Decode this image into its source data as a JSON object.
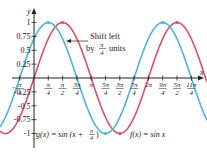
{
  "chart_data": {
    "type": "line",
    "title": "",
    "xlabel": "x",
    "ylabel": "y",
    "xlim": [
      -0.785,
      9.0
    ],
    "ylim": [
      -1.1,
      1.15
    ],
    "grid": false,
    "x_ticks": [
      "-π/4",
      "π/4",
      "π/2",
      "3π/4",
      "π",
      "5π/4",
      "3π/2",
      "7π/4",
      "2π",
      "9π/4",
      "5π/2",
      "11π/4"
    ],
    "y_ticks": [
      "-1",
      "-0.75",
      "-0.5",
      "-0.25",
      "0.25",
      "0.5",
      "0.75",
      "1"
    ],
    "series": [
      {
        "name": "f(x) = sin x",
        "color": "#d9506e",
        "function": "sin(x)"
      },
      {
        "name": "g(x) = sin (x + π/4)",
        "color": "#4fb3dc",
        "function": "sin(x + π/4)"
      }
    ],
    "annotations": [
      {
        "text_line1": "Shift left",
        "text_line2": "by π/4 units",
        "arrow_from": "f",
        "arrow_to": "g"
      }
    ]
  },
  "labels": {
    "y_axis": "y",
    "x_axis": "x",
    "shift_line1": "Shift left",
    "shift_by": "by",
    "shift_num": "π",
    "shift_den": "4",
    "shift_units": "units",
    "g_label": "g(x) = sin (x + ",
    "g_num": "π",
    "g_den": "4",
    "g_close": ")",
    "f_label": "f(x) = sin x",
    "y_tick_labels": [
      "1",
      "0.75",
      "0.5",
      "0.25",
      "-0.25",
      "-0.5",
      "-0.75",
      "-1"
    ]
  }
}
